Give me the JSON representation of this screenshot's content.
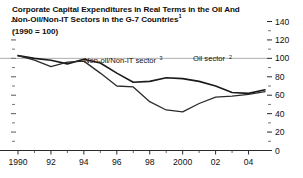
{
  "title": {
    "line1": "Corporate Capital Expenditures in Real Terms in the Oil And",
    "line2": "Non-Oil/Non-IT Sectors in the G-7 Countries",
    "line2_sup": "1",
    "subtitle": "(1990 = 100)"
  },
  "chart_data": {
    "type": "line",
    "title": "Corporate Capital Expenditures in Real Terms in the Oil And Non-Oil/Non-IT Sectors in the G-7 Countries",
    "subtitle": "(1990 = 100)",
    "xlabel": "",
    "ylabel": "",
    "grid": false,
    "gridline_at": 100,
    "legend_position": "inline-annotations",
    "xlim": [
      1990,
      2005
    ],
    "ylim": [
      0,
      140
    ],
    "x": [
      1990,
      1991,
      1992,
      1993,
      1994,
      1995,
      1996,
      1997,
      1998,
      1999,
      2000,
      2001,
      2002,
      2003,
      2004,
      2005
    ],
    "xticks": [
      1990,
      1992,
      1994,
      1996,
      1998,
      2000,
      2002,
      2004
    ],
    "xtick_labels": [
      "1990",
      "92",
      "94",
      "96",
      "98",
      "2000",
      "02",
      "04"
    ],
    "yticks": [
      0,
      20,
      40,
      60,
      80,
      100,
      120,
      140
    ],
    "ytick_labels": [
      "0",
      "20",
      "40",
      "60",
      "80",
      "100",
      "120",
      "140"
    ],
    "yminor_ticks": [
      10,
      30,
      50,
      70,
      90,
      110,
      130
    ],
    "series": [
      {
        "name": "Oil sector",
        "sup": "2",
        "color": "#1a1a1a",
        "width": 1.6,
        "label_x": 2001.6,
        "label_y": 97,
        "values": [
          103,
          100,
          98,
          94,
          99,
          95,
          84,
          74,
          75,
          79,
          78,
          75,
          70,
          63,
          62,
          66
        ]
      },
      {
        "name": "Non-oil/Non-IT sector",
        "sup": "3",
        "color": "#2b2b2b",
        "width": 1.3,
        "label_x": 1996.2,
        "label_y": 95,
        "values": [
          103,
          98,
          91,
          96,
          97,
          84,
          70,
          69,
          53,
          44,
          42,
          51,
          58,
          59,
          61,
          64
        ]
      }
    ]
  },
  "axis": {
    "ytick_labels": [
      "140",
      "120",
      "100",
      "80",
      "60",
      "40",
      "20",
      "0"
    ],
    "xtick_labels": [
      "1990",
      "92",
      "94",
      "96",
      "98",
      "2000",
      "02",
      "04"
    ]
  }
}
